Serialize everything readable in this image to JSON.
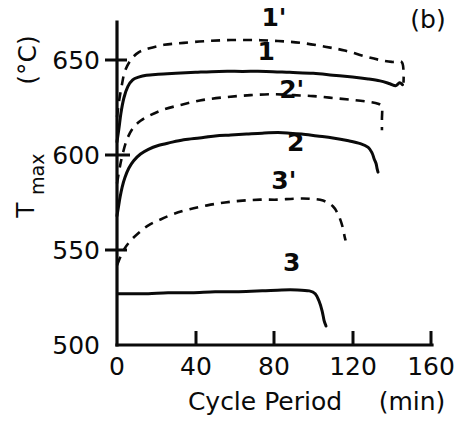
{
  "panel": {
    "label": "(b)"
  },
  "axes": {
    "x": {
      "title": "Cycle Period",
      "unit": "(min)",
      "ticks": [
        0,
        40,
        80,
        120,
        160
      ],
      "tick_labels": [
        "0",
        "40",
        "80",
        "120",
        "160"
      ],
      "min": 0,
      "max": 160
    },
    "y": {
      "title": "T",
      "title_sub": "max",
      "unit": "(°C)",
      "ticks": [
        500,
        550,
        600,
        650
      ],
      "tick_labels": [
        "500",
        "550",
        "600",
        "650"
      ],
      "min": 500,
      "max": 670
    }
  },
  "chart_data": {
    "type": "line",
    "title": "(b)",
    "xlabel": "Cycle Period (min)",
    "ylabel": "T_max (°C)",
    "xlim": [
      0,
      160
    ],
    "ylim": [
      500,
      670
    ],
    "grid": false,
    "legend": "inline-curve-labels",
    "xticks": [
      0,
      40,
      80,
      120,
      160
    ],
    "yticks": [
      500,
      550,
      600,
      650
    ],
    "series": [
      {
        "name": "1'",
        "style": "dashed",
        "label_x": 80,
        "label_y": 668,
        "x": [
          0,
          1,
          2.5,
          4,
          7,
          11,
          16,
          24,
          34,
          46,
          58,
          70,
          82,
          94,
          106,
          116,
          126,
          134,
          140,
          145,
          146,
          146
        ],
        "y": [
          620,
          628,
          637,
          644,
          650,
          654,
          656,
          658,
          659,
          660,
          660.5,
          660.5,
          660,
          659,
          657,
          655,
          652,
          650,
          649,
          649,
          644,
          638
        ]
      },
      {
        "name": "1",
        "style": "solid",
        "label_x": 76,
        "label_y": 650,
        "x": [
          0,
          1,
          2,
          3.5,
          5.5,
          8,
          11,
          15,
          21,
          30,
          40,
          52,
          64,
          76,
          88,
          100,
          110,
          120,
          128,
          134,
          139,
          142,
          144,
          145.5
        ],
        "y": [
          607,
          614,
          622,
          630,
          636,
          639.5,
          641,
          642,
          642.5,
          643,
          643.5,
          644,
          644,
          644,
          643.5,
          643,
          642,
          641,
          640,
          639,
          637.5,
          636.5,
          638,
          637
        ]
      },
      {
        "name": "2'",
        "style": "dashed",
        "label_x": 89,
        "label_y": 630,
        "x": [
          0,
          1.5,
          3,
          5,
          8,
          12,
          17,
          24,
          33,
          44,
          56,
          68,
          80,
          90,
          100,
          110,
          120,
          128,
          133,
          135,
          135,
          135
        ],
        "y": [
          585,
          594,
          601,
          608,
          614,
          618,
          621,
          624,
          626.5,
          629,
          630.5,
          631.5,
          632,
          631.5,
          631,
          630,
          629,
          628,
          627,
          625,
          619,
          613
        ]
      },
      {
        "name": "2",
        "style": "solid",
        "label_x": 91,
        "label_y": 602,
        "x": [
          0,
          0.8,
          1.6,
          2.6,
          4,
          6,
          8.5,
          12,
          16,
          21,
          27,
          34,
          42,
          50,
          58,
          66,
          74,
          82,
          88,
          94,
          102,
          110,
          118,
          124,
          128,
          130,
          131,
          132,
          132.5,
          133
        ],
        "y": [
          568,
          573,
          578,
          583,
          588,
          593,
          597,
          600.5,
          603,
          605,
          606.5,
          608,
          609,
          610,
          610.5,
          611,
          611.5,
          611.8,
          611.5,
          611,
          610,
          609,
          607.5,
          606,
          604,
          601,
          598,
          595.5,
          593,
          591
        ]
      },
      {
        "name": "3'",
        "style": "dashed",
        "label_x": 85,
        "label_y": 582,
        "x": [
          0,
          2,
          4,
          7,
          11,
          16,
          22,
          29,
          37,
          46,
          55,
          64,
          73,
          82,
          90,
          98,
          105,
          110,
          113,
          115,
          116,
          116.5
        ],
        "y": [
          542,
          547,
          551,
          555,
          559,
          563,
          566,
          569,
          571.5,
          573.5,
          575,
          576,
          576.5,
          576.5,
          577,
          577,
          576,
          573,
          568,
          562,
          557,
          555
        ]
      },
      {
        "name": "3",
        "style": "solid",
        "label_x": 89,
        "label_y": 539,
        "x": [
          0.5,
          3,
          8,
          16,
          26,
          38,
          50,
          62,
          74,
          84,
          92,
          98,
          101,
          103,
          104.5,
          105.5,
          106.5
        ],
        "y": [
          527,
          527,
          527,
          527,
          527.5,
          527.5,
          528,
          528,
          528.5,
          529,
          529,
          528.5,
          527,
          523,
          518,
          513,
          510
        ]
      }
    ]
  }
}
